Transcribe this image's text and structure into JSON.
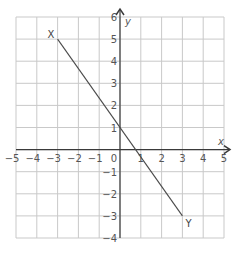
{
  "chart_data": {
    "type": "line",
    "title": "",
    "xlabel": "x",
    "ylabel": "y",
    "xlim": [
      -5,
      5
    ],
    "ylim": [
      -4,
      6
    ],
    "grid": true,
    "x_ticks": [
      -5,
      -4,
      -3,
      -2,
      -1,
      1,
      2,
      3,
      4,
      5
    ],
    "y_ticks": [
      -4,
      -3,
      -2,
      -1,
      1,
      2,
      3,
      4,
      5,
      6
    ],
    "origin_label": "0",
    "series": [
      {
        "name": "XY",
        "x": [
          -3,
          3
        ],
        "y": [
          5,
          -3
        ],
        "equation": "y = -4/3 x + 1"
      }
    ],
    "points": [
      {
        "label": "X",
        "x": -3,
        "y": 5
      },
      {
        "label": "Y",
        "x": 3,
        "y": -3
      }
    ]
  },
  "colors": {
    "grid": "#c9c9c9",
    "axis": "#3a3a3a",
    "line": "#4a4a4a",
    "text": "#555555"
  }
}
